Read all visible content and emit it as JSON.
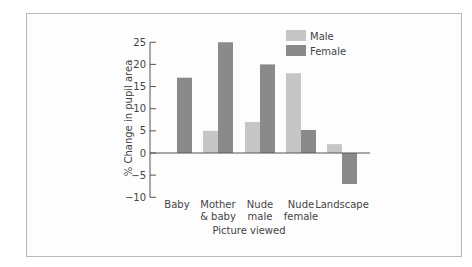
{
  "chart_data": {
    "type": "bar",
    "title": "",
    "xlabel": "Picture viewed",
    "ylabel": "% Change in pupil area",
    "ylim": [
      -10,
      25
    ],
    "yticks": [
      25,
      20,
      15,
      10,
      5,
      0,
      -5,
      -10
    ],
    "ytick_labels": [
      "25",
      "20",
      "15",
      "10",
      "5",
      "0",
      "−5",
      "−10"
    ],
    "categories": [
      [
        "Baby"
      ],
      [
        "Mother",
        "& baby"
      ],
      [
        "Nude",
        "male"
      ],
      [
        "Nude",
        "female"
      ],
      [
        "Landscape"
      ]
    ],
    "series": [
      {
        "name": "Male",
        "color": "#c6c6c6",
        "values": [
          null,
          5,
          7,
          18,
          2
        ]
      },
      {
        "name": "Female",
        "color": "#8a8a8a",
        "values": [
          17,
          25,
          20,
          5.2,
          -7
        ]
      }
    ],
    "grid": false,
    "legend_position": "upper right"
  },
  "legend": {
    "male": "Male",
    "female": "Female"
  }
}
